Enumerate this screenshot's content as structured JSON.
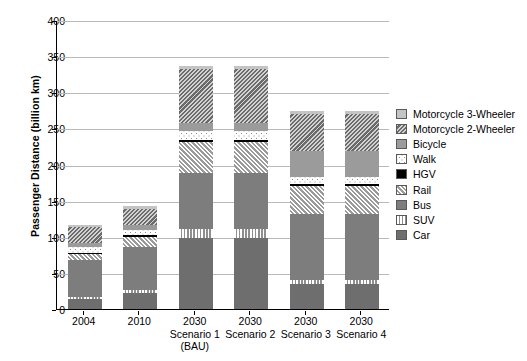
{
  "chart_data": {
    "type": "bar",
    "subtype": "stacked-vertical",
    "title": "",
    "xlabel": "",
    "ylabel": "Passenger Distance (billion km)",
    "ylim": [
      0,
      400
    ],
    "yticks": [
      0,
      50,
      100,
      150,
      200,
      250,
      300,
      350,
      400
    ],
    "grid": "horizontal",
    "legend_position": "right",
    "categories": [
      "2004",
      "2010",
      "2030 Scenario 1 (BAU)",
      "2030 Scenario 2",
      "2030 Scenario 3",
      "2030 Scenario 4"
    ],
    "category_lines": [
      [
        "2004",
        "",
        ""
      ],
      [
        "2010",
        "",
        ""
      ],
      [
        "2030",
        "Scenario 1",
        "(BAU)"
      ],
      [
        "2030",
        "Scenario 2",
        ""
      ],
      [
        "2030",
        "Scenario 3",
        ""
      ],
      [
        "2030",
        "Scenario 4",
        ""
      ]
    ],
    "series": [
      {
        "name": "Car",
        "pattern": "solid-dark-grey",
        "color": "#6e6e6e",
        "values": [
          14,
          22,
          98,
          98,
          35,
          35
        ]
      },
      {
        "name": "SUV",
        "pattern": "vertical-stripes",
        "color": "#8f8f8f",
        "values": [
          3,
          4,
          13,
          13,
          5,
          5
        ]
      },
      {
        "name": "Bus",
        "pattern": "solid-mid-grey",
        "color": "#7d7d7d",
        "values": [
          51,
          60,
          77,
          77,
          92,
          92
        ]
      },
      {
        "name": "Rail",
        "pattern": "diagonal-hatch",
        "color": "#9a9a9a",
        "values": [
          8,
          14,
          43,
          43,
          38,
          38
        ]
      },
      {
        "name": "HGV",
        "pattern": "solid-black",
        "color": "#000000",
        "values": [
          2,
          2,
          3,
          3,
          3,
          3
        ]
      },
      {
        "name": "Walk",
        "pattern": "dotted",
        "color": "#8d8d8d",
        "values": [
          8,
          8,
          12,
          12,
          10,
          10
        ]
      },
      {
        "name": "Bicycle",
        "pattern": "solid-light-grey",
        "color": "#9b9b9b",
        "values": [
          5,
          6,
          11,
          11,
          36,
          36
        ]
      },
      {
        "name": "Motorcycle 2-Wheeler",
        "pattern": "dense-diagonal-hatch",
        "color": "#6b6b6b",
        "values": [
          23,
          23,
          75,
          75,
          51,
          51
        ]
      },
      {
        "name": "Motorcycle 3-Wheeler",
        "pattern": "solid-pale-grey",
        "color": "#c4c4c4",
        "values": [
          3,
          3,
          5,
          5,
          4,
          4
        ]
      }
    ],
    "totals": [
      117,
      142,
      337,
      337,
      274,
      274
    ]
  },
  "legend": {
    "items": [
      {
        "label": "Motorcycle 3-Wheeler",
        "swatch": "p-m3"
      },
      {
        "label": "Motorcycle 2-Wheeler",
        "swatch": "p-m2"
      },
      {
        "label": "Bicycle",
        "swatch": "p-bike"
      },
      {
        "label": "Walk",
        "swatch": "p-walk"
      },
      {
        "label": "HGV",
        "swatch": "p-hgv"
      },
      {
        "label": "Rail",
        "swatch": "p-rail"
      },
      {
        "label": "Bus",
        "swatch": "p-bus"
      },
      {
        "label": "SUV",
        "swatch": "p-suv"
      },
      {
        "label": "Car",
        "swatch": "p-car"
      }
    ]
  }
}
